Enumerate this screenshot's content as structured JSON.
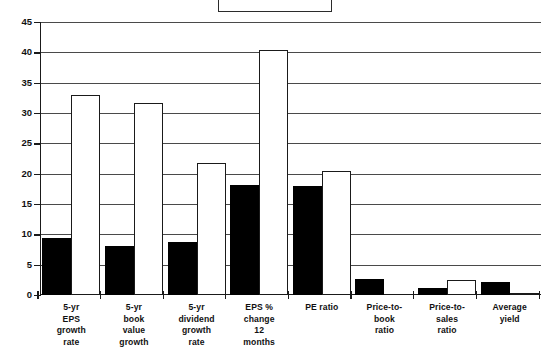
{
  "chart_data": {
    "type": "bar",
    "title": "",
    "subtitle": "",
    "xlabel": "",
    "ylabel": "",
    "ylim": [
      0,
      45
    ],
    "ytick_step": 5,
    "yticks": [
      0,
      5,
      10,
      15,
      20,
      25,
      30,
      35,
      40,
      45
    ],
    "ytick_labels": [
      "0",
      "5",
      "10",
      "15",
      "20",
      "25",
      "30",
      "35",
      "40",
      "45"
    ],
    "grid": true,
    "grid_axis": "y",
    "legend_position": "top-center",
    "legend_entries": [],
    "categories": [
      "5-yr EPS growth rate",
      "5-yr book value growth",
      "5-yr dividend growth rate",
      "EPS % change 12 months",
      "PE ratio",
      "Price-to-book ratio",
      "Price-to-sales ratio",
      "Average yield"
    ],
    "category_label_lines": [
      [
        "5-yr",
        "EPS",
        "growth",
        "rate"
      ],
      [
        "5-yr",
        "book",
        "value",
        "growth"
      ],
      [
        "5-yr",
        "dividend",
        "growth",
        "rate"
      ],
      [
        "EPS %",
        "change",
        "12",
        "months"
      ],
      [
        "PE ratio"
      ],
      [
        "Price-to-",
        "book",
        "ratio"
      ],
      [
        "Price-to-",
        "sales",
        "ratio"
      ],
      [
        "Average",
        "yield"
      ]
    ],
    "series": [
      {
        "name": "series-dark",
        "color": "#000000",
        "values": [
          9.4,
          8.0,
          8.8,
          18.2,
          18.0,
          2.7,
          1.1,
          2.2
        ]
      },
      {
        "name": "series-light",
        "color": "#ffffff",
        "values": [
          33.0,
          31.7,
          21.8,
          40.4,
          20.5,
          0.0,
          2.4,
          0.3
        ]
      }
    ]
  },
  "axis": {
    "y_axis_name": "value-axis",
    "x_axis_name": "category-axis"
  },
  "legend": {
    "box_name": "legend-box",
    "text": ""
  }
}
